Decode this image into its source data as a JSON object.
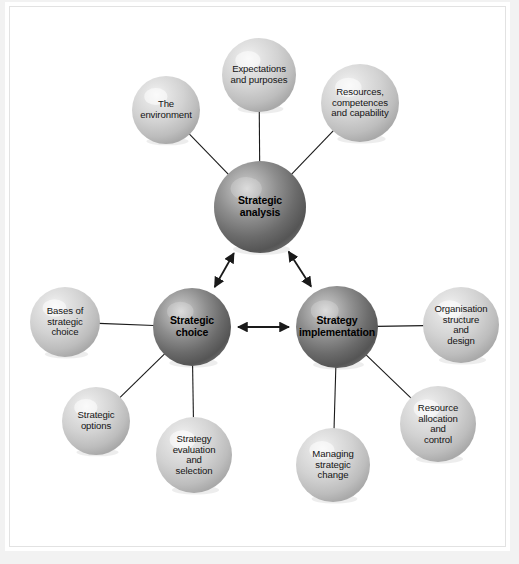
{
  "figure": {
    "background_color": "#f2f2f2",
    "plate_color": "#ffffff",
    "core_sphere_color": "#6e6e6e",
    "satellite_sphere_color": "#c8c8c8",
    "connector_color": "#1a1a1a"
  },
  "core_nodes": [
    {
      "id": "strategic-analysis",
      "label": "Strategic\nanalysis",
      "cx": 260,
      "cy": 207,
      "r": 46
    },
    {
      "id": "strategic-choice",
      "label": "Strategic\nchoice",
      "cx": 192,
      "cy": 327,
      "r": 39
    },
    {
      "id": "strategy-implementation",
      "label": "Strategy\nimplementation",
      "cx": 337,
      "cy": 327,
      "r": 41
    }
  ],
  "satellite_nodes": [
    {
      "id": "the-environment",
      "label": "The\nenvironment",
      "cx": 166,
      "cy": 110,
      "r": 34,
      "parent": "strategic-analysis"
    },
    {
      "id": "expectations-and-purposes",
      "label": "Expectations\nand purposes",
      "cx": 259,
      "cy": 75,
      "r": 37,
      "parent": "strategic-analysis"
    },
    {
      "id": "resources-competences-and-capability",
      "label": "Resources,\ncompetences\nand capability",
      "cx": 360,
      "cy": 103,
      "r": 39,
      "parent": "strategic-analysis"
    },
    {
      "id": "bases-of-strategic-choice",
      "label": "Bases of\nstrategic\nchoice",
      "cx": 65,
      "cy": 322,
      "r": 35,
      "parent": "strategic-choice"
    },
    {
      "id": "strategic-options",
      "label": "Strategic\noptions",
      "cx": 96,
      "cy": 421,
      "r": 34,
      "parent": "strategic-choice"
    },
    {
      "id": "strategy-evaluation-and-selection",
      "label": "Strategy\nevaluation\nand\nselection",
      "cx": 194,
      "cy": 455,
      "r": 38,
      "parent": "strategic-choice"
    },
    {
      "id": "managing-strategic-change",
      "label": "Managing\nstrategic\nchange",
      "cx": 333,
      "cy": 465,
      "r": 37,
      "parent": "strategy-implementation"
    },
    {
      "id": "resource-allocation-and-control",
      "label": "Resource\nallocation\nand\ncontrol",
      "cx": 438,
      "cy": 424,
      "r": 38,
      "parent": "strategy-implementation"
    },
    {
      "id": "organisation-structure-and-design",
      "label": "Organisation\nstructure\nand\ndesign",
      "cx": 461,
      "cy": 325,
      "r": 38,
      "parent": "strategy-implementation"
    }
  ],
  "core_connectors": [
    {
      "id": "analysis-choice",
      "from": "strategic-analysis",
      "to": "strategic-choice",
      "style": "double-arrow"
    },
    {
      "id": "analysis-implementation",
      "from": "strategic-analysis",
      "to": "strategy-implementation",
      "style": "double-arrow"
    },
    {
      "id": "choice-implementation",
      "from": "strategic-choice",
      "to": "strategy-implementation",
      "style": "double-arrow"
    }
  ],
  "satellite_connectors": [
    {
      "id": "env-to-analysis",
      "from": "the-environment",
      "to": "strategic-analysis",
      "style": "line"
    },
    {
      "id": "expect-to-analysis",
      "from": "expectations-and-purposes",
      "to": "strategic-analysis",
      "style": "line"
    },
    {
      "id": "resources-to-analysis",
      "from": "resources-competences-and-capability",
      "to": "strategic-analysis",
      "style": "line"
    },
    {
      "id": "bases-to-choice",
      "from": "bases-of-strategic-choice",
      "to": "strategic-choice",
      "style": "line"
    },
    {
      "id": "options-to-choice",
      "from": "strategic-options",
      "to": "strategic-choice",
      "style": "line"
    },
    {
      "id": "evaluation-to-choice",
      "from": "strategy-evaluation-and-selection",
      "to": "strategic-choice",
      "style": "line"
    },
    {
      "id": "change-to-implementation",
      "from": "managing-strategic-change",
      "to": "strategy-implementation",
      "style": "line"
    },
    {
      "id": "resource-alloc-to-implementation",
      "from": "resource-allocation-and-control",
      "to": "strategy-implementation",
      "style": "line"
    },
    {
      "id": "org-structure-to-implementation",
      "from": "organisation-structure-and-design",
      "to": "strategy-implementation",
      "style": "line"
    }
  ]
}
